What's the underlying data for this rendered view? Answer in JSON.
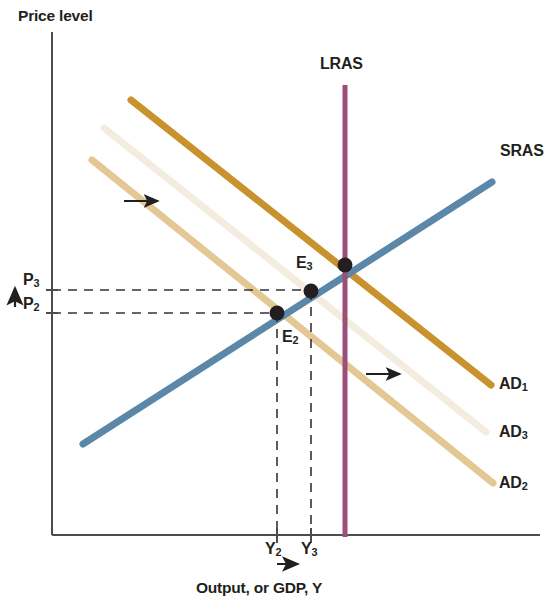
{
  "figure": {
    "type": "economics-diagram",
    "name": "AD-AS model with aggregate demand shift",
    "background": "#ffffff"
  },
  "axes": {
    "y_title": "Price level",
    "x_title": "Output, or GDP, Y",
    "axis_color": "#4c4c4c",
    "origin": {
      "x": 52,
      "y": 535
    },
    "y_top": 32,
    "x_right": 540
  },
  "curves": [
    {
      "id": "lras",
      "label": "LRAS",
      "color": "#9c4f78",
      "orientation": "vertical",
      "x1": 345,
      "y1": 85,
      "x2": 345,
      "y2": 537,
      "width": 5,
      "label_pos": {
        "x": 320,
        "y": 56
      }
    },
    {
      "id": "sras",
      "label": "SRAS",
      "color": "#5b87a8",
      "orientation": "upward-sloping",
      "x1": 83,
      "y1": 444,
      "x2": 492,
      "y2": 182,
      "width": 7,
      "label_pos": {
        "x": 500,
        "y": 143
      }
    },
    {
      "id": "ad1",
      "label": "AD",
      "label_sub": "1",
      "color": "#c8922c",
      "orientation": "downward-sloping",
      "x1": 131,
      "y1": 100,
      "x2": 491,
      "y2": 385,
      "width": 7,
      "label_pos": {
        "x": 499,
        "y": 376
      }
    },
    {
      "id": "ad3",
      "label": "AD",
      "label_sub": "3",
      "color": "#f3ecdf",
      "orientation": "downward-sloping",
      "x1": 104,
      "y1": 128,
      "x2": 486,
      "y2": 432,
      "width": 7,
      "label_pos": {
        "x": 499,
        "y": 424
      }
    },
    {
      "id": "ad2",
      "label": "AD",
      "label_sub": "2",
      "color": "#e3c896",
      "orientation": "downward-sloping",
      "x1": 92,
      "y1": 160,
      "x2": 493,
      "y2": 483,
      "width": 7,
      "label_pos": {
        "x": 499,
        "y": 475
      }
    }
  ],
  "points": [
    {
      "id": "e2",
      "label": "E",
      "label_sub": "2",
      "x": 277,
      "y": 313,
      "r": 7,
      "color": "#231f20"
    },
    {
      "id": "e3",
      "label": "E",
      "label_sub": "3",
      "x": 311,
      "y": 291,
      "r": 7,
      "color": "#231f20"
    },
    {
      "id": "e1",
      "label": "",
      "label_sub": "",
      "x": 345,
      "y": 265,
      "r": 7,
      "color": "#231f20"
    }
  ],
  "price_ticks": [
    {
      "id": "p3",
      "label": "P",
      "label_sub": "3",
      "y": 290,
      "dash_to_x": 311
    },
    {
      "id": "p2",
      "label": "P",
      "label_sub": "2",
      "y": 313,
      "dash_to_x": 277
    }
  ],
  "output_ticks": [
    {
      "id": "y2",
      "label": "Y",
      "label_sub": "2",
      "x": 277,
      "dash_from_y": 313
    },
    {
      "id": "y3",
      "label": "Y",
      "label_sub": "3",
      "x": 311,
      "dash_from_y": 291
    }
  ],
  "shift_arrows": [
    {
      "id": "arrow-ad-upper",
      "x1": 124,
      "y1": 201,
      "x2": 163,
      "y2": 201,
      "direction": "right"
    },
    {
      "id": "arrow-ad-lower",
      "x1": 366,
      "y1": 374,
      "x2": 405,
      "y2": 374,
      "direction": "right"
    },
    {
      "id": "arrow-price-up",
      "x1": 14,
      "y1": 305,
      "x2": 14,
      "y2": 283,
      "direction": "up"
    },
    {
      "id": "arrow-output-right",
      "x1": 275,
      "y1": 565,
      "x2": 300,
      "y2": 565,
      "direction": "right"
    }
  ],
  "dash_style": {
    "color": "#333333",
    "width": 1.6,
    "pattern": "9,7"
  }
}
